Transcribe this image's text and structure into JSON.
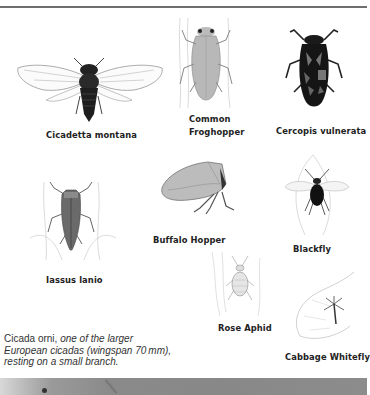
{
  "page": {
    "figures": [
      {
        "id": "cicadetta-montana",
        "label": "Cicadetta montana"
      },
      {
        "id": "common-froghopper",
        "label_line1": "Common",
        "label_line2": "Froghopper"
      },
      {
        "id": "cercopis-vulnerata",
        "label": "Cercopis vulnerata"
      },
      {
        "id": "iassus-lanio",
        "label": "Iassus lanio"
      },
      {
        "id": "buffalo-hopper",
        "label": "Buffalo Hopper"
      },
      {
        "id": "blackfly",
        "label": "Blackfly"
      },
      {
        "id": "rose-aphid",
        "label": "Rose Aphid"
      },
      {
        "id": "cabbage-whitefly",
        "label": "Cabbage Whitefly"
      }
    ],
    "caption": {
      "plain": "Cicada orni,",
      "italic_line1": " one of the larger",
      "italic_line2": "European cicadas (wingspan 70 mm),",
      "italic_line3": "resting on a small branch."
    },
    "colors": {
      "rule": "#6e6e6e",
      "ink": "#222222",
      "photo_strip": "#8a8a8a"
    }
  }
}
